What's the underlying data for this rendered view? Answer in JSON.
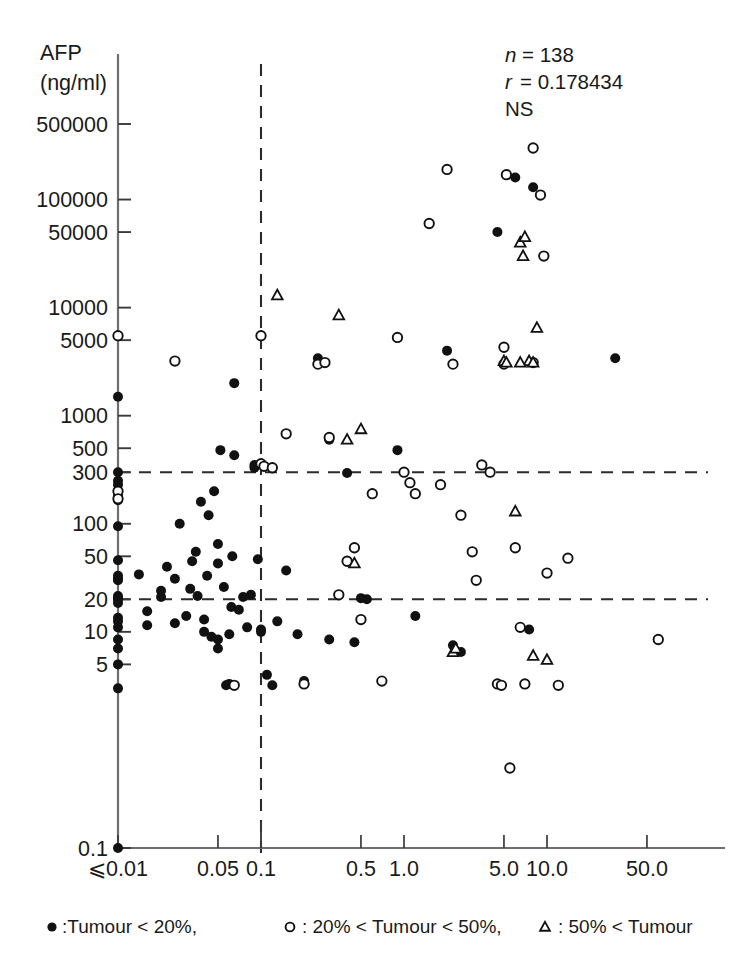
{
  "chart_data": {
    "type": "scatter",
    "title": "",
    "xlabel": "PIVKA-II",
    "xunit": "(AU/ml)",
    "ylabel": "AFP",
    "yunit": "(ng/ml)",
    "xlabel_full": "PIVKA-II (AU/ml)",
    "ylabel_full": "AFP (ng/ml)",
    "x_scale": "log",
    "y_scale": "log",
    "xlim": [
      0.01,
      100.0
    ],
    "ylim": [
      0.1,
      500000
    ],
    "grid": false,
    "legend_position": "below-axis",
    "x_ticklabels": [
      "⩽0.01",
      "0.05",
      "0.1",
      "0.5",
      "1.0",
      "5.0",
      "10.0",
      "50.0"
    ],
    "x_tickvalues": [
      0.01,
      0.05,
      0.1,
      0.5,
      1.0,
      5.0,
      10.0,
      50.0
    ],
    "y_ticklabels": [
      "0.1",
      "5",
      "10",
      "20",
      "50",
      "100",
      "300",
      "500",
      "1000",
      "5000",
      "10000",
      "50000",
      "100000",
      "500000"
    ],
    "y_tickvalues": [
      0.1,
      5,
      10,
      20,
      50,
      100,
      300,
      500,
      1000,
      5000,
      10000,
      50000,
      100000,
      500000
    ],
    "reference_lines": [
      {
        "axis": "y",
        "value": 300,
        "style": "dashed"
      },
      {
        "axis": "y",
        "value": 20,
        "style": "dashed"
      },
      {
        "axis": "x",
        "value": 0.1,
        "style": "dashed"
      }
    ],
    "annotations": {
      "n_label": "n",
      "n_eq": "= 138",
      "n_value": 138,
      "r_label": "r",
      "r_eq": "= 0.178434",
      "r_value": 0.178434,
      "significance": "NS"
    },
    "legend": [
      {
        "marker": "filled-circle",
        "text": ":Tumour < 20%,"
      },
      {
        "marker": "open-circle",
        "text": ": 20% < Tumour < 50%,"
      },
      {
        "marker": "triangle",
        "text": ": 50% < Tumour"
      }
    ],
    "series": [
      {
        "name": "Tumour < 20%",
        "marker": "filled-circle",
        "points": [
          [
            0.01,
            0.1
          ],
          [
            0.01,
            3.0
          ],
          [
            0.01,
            5.0
          ],
          [
            0.01,
            7.0
          ],
          [
            0.01,
            8.5
          ],
          [
            0.01,
            11.0
          ],
          [
            0.01,
            12.5
          ],
          [
            0.01,
            13.5
          ],
          [
            0.01,
            18.5
          ],
          [
            0.01,
            20.0
          ],
          [
            0.01,
            20.5
          ],
          [
            0.01,
            21.5
          ],
          [
            0.01,
            30.0
          ],
          [
            0.01,
            31.0
          ],
          [
            0.01,
            33.0
          ],
          [
            0.01,
            46.0
          ],
          [
            0.01,
            95.0
          ],
          [
            0.01,
            165.0
          ],
          [
            0.01,
            185.0
          ],
          [
            0.01,
            230.0
          ],
          [
            0.01,
            250.0
          ],
          [
            0.01,
            300.0
          ],
          [
            0.01,
            1500.0
          ],
          [
            0.014,
            34.0
          ],
          [
            0.016,
            11.5
          ],
          [
            0.016,
            15.5
          ],
          [
            0.02,
            21.0
          ],
          [
            0.02,
            24.0
          ],
          [
            0.022,
            40.0
          ],
          [
            0.025,
            12.0
          ],
          [
            0.025,
            31.0
          ],
          [
            0.027,
            100.0
          ],
          [
            0.03,
            14.0
          ],
          [
            0.032,
            25.0
          ],
          [
            0.033,
            45.0
          ],
          [
            0.035,
            55.0
          ],
          [
            0.036,
            21.5
          ],
          [
            0.038,
            160.0
          ],
          [
            0.04,
            10.0
          ],
          [
            0.04,
            13.0
          ],
          [
            0.042,
            33.0
          ],
          [
            0.043,
            120.0
          ],
          [
            0.045,
            9.0
          ],
          [
            0.047,
            200.0
          ],
          [
            0.05,
            7.0
          ],
          [
            0.05,
            8.5
          ],
          [
            0.05,
            43.0
          ],
          [
            0.05,
            65.0
          ],
          [
            0.052,
            480.0
          ],
          [
            0.055,
            26.0
          ],
          [
            0.057,
            3.2
          ],
          [
            0.06,
            3.3
          ],
          [
            0.06,
            9.5
          ],
          [
            0.062,
            17.0
          ],
          [
            0.063,
            50.0
          ],
          [
            0.065,
            430.0
          ],
          [
            0.065,
            2000.0
          ],
          [
            0.07,
            16.0
          ],
          [
            0.075,
            21.0
          ],
          [
            0.08,
            11.0
          ],
          [
            0.085,
            22.0
          ],
          [
            0.09,
            330.0
          ],
          [
            0.09,
            350.0
          ],
          [
            0.095,
            47.0
          ],
          [
            0.1,
            10.5
          ],
          [
            0.1,
            10.0
          ],
          [
            0.11,
            4.0
          ],
          [
            0.12,
            3.2
          ],
          [
            0.13,
            12.5
          ],
          [
            0.15,
            37.0
          ],
          [
            0.18,
            9.5
          ],
          [
            0.2,
            3.5
          ],
          [
            0.25,
            3400.0
          ],
          [
            0.3,
            8.5
          ],
          [
            0.3,
            600.0
          ],
          [
            0.4,
            295.0
          ],
          [
            0.45,
            8.0
          ],
          [
            0.5,
            20.5
          ],
          [
            0.55,
            20.0
          ],
          [
            0.9,
            480.0
          ],
          [
            1.2,
            14.0
          ],
          [
            2.0,
            4000.0
          ],
          [
            2.2,
            7.5
          ],
          [
            2.5,
            6.5
          ],
          [
            4.5,
            50000.0
          ],
          [
            6.0,
            160000.0
          ],
          [
            7.5,
            10.5
          ],
          [
            8.0,
            130000.0
          ],
          [
            30.0,
            3400.0
          ]
        ]
      },
      {
        "name": "20% < Tumour < 50%",
        "marker": "open-circle",
        "points": [
          [
            0.01,
            5500.0
          ],
          [
            0.01,
            200.0
          ],
          [
            0.025,
            3200.0
          ],
          [
            0.065,
            3.2
          ],
          [
            0.1,
            5500.0
          ],
          [
            0.1,
            360.0
          ],
          [
            0.105,
            340.0
          ],
          [
            0.12,
            330.0
          ],
          [
            0.15,
            680.0
          ],
          [
            0.2,
            3.3
          ],
          [
            0.25,
            3000.0
          ],
          [
            0.28,
            3100.0
          ],
          [
            0.3,
            630.0
          ],
          [
            0.35,
            22.0
          ],
          [
            0.4,
            45.0
          ],
          [
            0.45,
            60.0
          ],
          [
            0.5,
            13.0
          ],
          [
            0.6,
            190.0
          ],
          [
            0.7,
            3.5
          ],
          [
            0.9,
            5300.0
          ],
          [
            1.0,
            300.0
          ],
          [
            1.1,
            240.0
          ],
          [
            1.2,
            190.0
          ],
          [
            1.5,
            60000.0
          ],
          [
            1.8,
            230.0
          ],
          [
            2.0,
            190000.0
          ],
          [
            2.2,
            3000.0
          ],
          [
            2.5,
            120.0
          ],
          [
            3.0,
            55.0
          ],
          [
            3.2,
            30.0
          ],
          [
            3.5,
            350.0
          ],
          [
            4.0,
            300.0
          ],
          [
            4.5,
            3.3
          ],
          [
            4.8,
            3.2
          ],
          [
            5.0,
            4300.0
          ],
          [
            5.0,
            3000.0
          ],
          [
            5.2,
            170000.0
          ],
          [
            5.5,
            0.55
          ],
          [
            6.0,
            60.0
          ],
          [
            6.5,
            11.0
          ],
          [
            7.0,
            3.3
          ],
          [
            8.0,
            300000.0
          ],
          [
            8.0,
            3100.0
          ],
          [
            9.0,
            110000.0
          ],
          [
            9.5,
            30000.0
          ],
          [
            10.0,
            35.0
          ],
          [
            12.0,
            3.2
          ],
          [
            14.0,
            48.0
          ],
          [
            60.0,
            8.5
          ],
          [
            0.01,
            170.0
          ]
        ]
      },
      {
        "name": "50% < Tumour",
        "marker": "triangle",
        "points": [
          [
            0.13,
            13000.0
          ],
          [
            0.35,
            8500.0
          ],
          [
            0.5,
            750.0
          ],
          [
            0.4,
            600.0
          ],
          [
            0.45,
            43.0
          ],
          [
            2.2,
            6.5
          ],
          [
            5.0,
            3200.0
          ],
          [
            5.2,
            3100.0
          ],
          [
            6.0,
            130.0
          ],
          [
            6.5,
            40000.0
          ],
          [
            6.8,
            30000.0
          ],
          [
            7.0,
            45000.0
          ],
          [
            7.5,
            3200.0
          ],
          [
            8.0,
            3100.0
          ],
          [
            8.5,
            6500.0
          ],
          [
            8.0,
            6.0
          ],
          [
            10.0,
            5.5
          ],
          [
            2.3,
            7.0
          ],
          [
            6.5,
            3100.0
          ]
        ]
      }
    ]
  }
}
